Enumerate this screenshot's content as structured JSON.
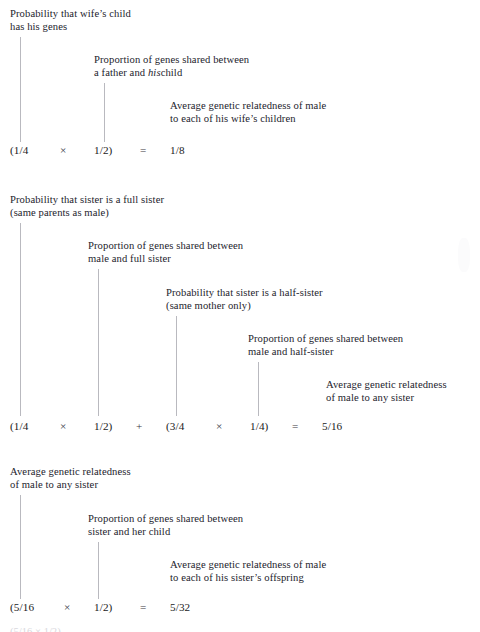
{
  "figure": {
    "type": "annotated-equation-diagram",
    "background_color": "#ffffff",
    "text_color": "#23232c",
    "leader_line_color": "#b9b9bf"
  },
  "blocks": [
    {
      "id": "wifes-child",
      "labels": [
        {
          "lines": [
            "Probability that wife’s child",
            "has his genes"
          ]
        },
        {
          "lines": [
            "Proportion of genes shared between",
            "a father and ",
            "child"
          ],
          "italic_word": "his"
        },
        {
          "lines": [
            "Average genetic relatedness of male",
            "to each of his wife’s children"
          ]
        }
      ],
      "equation": {
        "tokens": [
          "(1/4",
          "×",
          "1/2)",
          "=",
          "1/8"
        ],
        "result": "1/8"
      }
    },
    {
      "id": "any-sister",
      "labels": [
        {
          "lines": [
            "Probability that sister is a full sister",
            "(same parents as male)"
          ]
        },
        {
          "lines": [
            "Proportion of genes shared between",
            "male and full sister"
          ]
        },
        {
          "lines": [
            "Probability that sister is a half-sister",
            "(same mother only)"
          ]
        },
        {
          "lines": [
            "Proportion of genes shared between",
            "male and half-sister"
          ]
        },
        {
          "lines": [
            "Average genetic relatedness",
            "of male to any sister"
          ]
        }
      ],
      "equation": {
        "tokens": [
          "(1/4",
          "×",
          "1/2)",
          "+",
          "(3/4",
          "×",
          "1/4)",
          "=",
          "5/16"
        ],
        "result": "5/16"
      }
    },
    {
      "id": "sisters-offspring",
      "labels": [
        {
          "lines": [
            "Average genetic relatedness",
            "of male to any sister"
          ]
        },
        {
          "lines": [
            "Proportion of genes shared between",
            "sister and her child"
          ]
        },
        {
          "lines": [
            "Average genetic relatedness of male",
            "to each of his sister’s offspring"
          ]
        }
      ],
      "equation": {
        "tokens": [
          "(5/16",
          "×",
          "1/2)",
          "=",
          "5/32"
        ],
        "result": "5/32"
      }
    }
  ],
  "cutoff_text": "(5/16  ×  1/2)"
}
